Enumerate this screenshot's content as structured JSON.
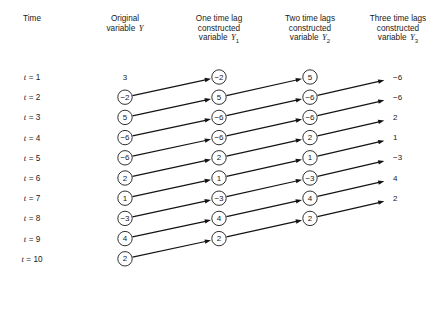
{
  "figure": {
    "columns": [
      {
        "id": "time",
        "header_lines": [
          "Time"
        ],
        "center_x": 32
      },
      {
        "id": "y",
        "header_lines": [
          "Original",
          "variable Y"
        ],
        "center_x": 125,
        "var_name": "Y",
        "var_sub": ""
      },
      {
        "id": "y1",
        "header_lines": [
          "One time lag",
          "constructed",
          "variable Y1"
        ],
        "center_x": 219,
        "var_name": "Y",
        "var_sub": "1"
      },
      {
        "id": "y2",
        "header_lines": [
          "Two time lags",
          "constructed",
          "variable Y2"
        ],
        "center_x": 310,
        "var_name": "Y",
        "var_sub": "2"
      },
      {
        "id": "y3",
        "header_lines": [
          "Three time lags",
          "constructed",
          "variable Y3"
        ],
        "center_x": 398,
        "var_name": "Y",
        "var_sub": "3"
      }
    ],
    "header_text": {
      "time": "Time",
      "y_line1": "Original",
      "y_line2": "variable",
      "y1_line1": "One time lag",
      "y1_line2": "constructed",
      "y1_line3": "variable",
      "y2_line1": "Two time lags",
      "y2_line2": "constructed",
      "y2_line3": "variable",
      "y3_line1": "Three time lags",
      "y3_line2": "constructed",
      "y3_line3": "variable",
      "var_letter": "Y",
      "sub1": "1",
      "sub2": "2",
      "sub3": "3"
    },
    "time_labels": [
      "t = 1",
      "t = 2",
      "t = 3",
      "t = 4",
      "t = 5",
      "t = 6",
      "t = 7",
      "t = 8",
      "t = 9",
      "t = 10"
    ],
    "time_var": "t",
    "time_values": [
      1,
      2,
      3,
      4,
      5,
      6,
      7,
      8,
      9,
      10
    ],
    "series": {
      "y": {
        "label": "Original variable Y",
        "values": [
          "3",
          "−2",
          "5",
          "−6",
          "−6",
          "2",
          "1",
          "−3",
          "4",
          "2"
        ],
        "circled": [
          false,
          true,
          true,
          true,
          true,
          true,
          true,
          true,
          true,
          true
        ],
        "rows": [
          1,
          2,
          3,
          4,
          5,
          6,
          7,
          8,
          9,
          10
        ]
      },
      "y1": {
        "label": "One time lag constructed variable Y1",
        "values": [
          "−2",
          "5",
          "−6",
          "−6",
          "2",
          "1",
          "−3",
          "4",
          "2"
        ],
        "circled": [
          true,
          true,
          true,
          true,
          true,
          true,
          true,
          true,
          true
        ],
        "rows": [
          1,
          2,
          3,
          4,
          5,
          6,
          7,
          8,
          9
        ]
      },
      "y2": {
        "label": "Two time lags constructed variable Y2",
        "values": [
          "5",
          "−6",
          "−6",
          "2",
          "1",
          "−3",
          "4",
          "2"
        ],
        "circled": [
          true,
          true,
          true,
          true,
          true,
          true,
          true,
          true
        ],
        "rows": [
          1,
          2,
          3,
          4,
          5,
          6,
          7,
          8
        ]
      },
      "y3": {
        "label": "Three time lags constructed variable Y3",
        "values": [
          "−6",
          "−6",
          "2",
          "1",
          "−3",
          "4",
          "2"
        ],
        "circled": [
          false,
          false,
          false,
          false,
          false,
          false,
          false
        ],
        "rows": [
          1,
          2,
          3,
          4,
          5,
          6,
          7
        ]
      }
    },
    "arrows": [
      {
        "from_col": "y",
        "from_row": 2,
        "to_col": "y1",
        "to_row": 1
      },
      {
        "from_col": "y",
        "from_row": 3,
        "to_col": "y1",
        "to_row": 2
      },
      {
        "from_col": "y",
        "from_row": 4,
        "to_col": "y1",
        "to_row": 3
      },
      {
        "from_col": "y",
        "from_row": 5,
        "to_col": "y1",
        "to_row": 4
      },
      {
        "from_col": "y",
        "from_row": 6,
        "to_col": "y1",
        "to_row": 5
      },
      {
        "from_col": "y",
        "from_row": 7,
        "to_col": "y1",
        "to_row": 6
      },
      {
        "from_col": "y",
        "from_row": 8,
        "to_col": "y1",
        "to_row": 7
      },
      {
        "from_col": "y",
        "from_row": 9,
        "to_col": "y1",
        "to_row": 8
      },
      {
        "from_col": "y",
        "from_row": 10,
        "to_col": "y1",
        "to_row": 9
      },
      {
        "from_col": "y1",
        "from_row": 2,
        "to_col": "y2",
        "to_row": 1
      },
      {
        "from_col": "y1",
        "from_row": 3,
        "to_col": "y2",
        "to_row": 2
      },
      {
        "from_col": "y1",
        "from_row": 4,
        "to_col": "y2",
        "to_row": 3
      },
      {
        "from_col": "y1",
        "from_row": 5,
        "to_col": "y2",
        "to_row": 4
      },
      {
        "from_col": "y1",
        "from_row": 6,
        "to_col": "y2",
        "to_row": 5
      },
      {
        "from_col": "y1",
        "from_row": 7,
        "to_col": "y2",
        "to_row": 6
      },
      {
        "from_col": "y1",
        "from_row": 8,
        "to_col": "y2",
        "to_row": 7
      },
      {
        "from_col": "y1",
        "from_row": 9,
        "to_col": "y2",
        "to_row": 8
      },
      {
        "from_col": "y2",
        "from_row": 2,
        "to_col": "y3",
        "to_row": 1
      },
      {
        "from_col": "y2",
        "from_row": 3,
        "to_col": "y3",
        "to_row": 2
      },
      {
        "from_col": "y2",
        "from_row": 4,
        "to_col": "y3",
        "to_row": 3
      },
      {
        "from_col": "y2",
        "from_row": 5,
        "to_col": "y3",
        "to_row": 4
      },
      {
        "from_col": "y2",
        "from_row": 6,
        "to_col": "y3",
        "to_row": 5
      },
      {
        "from_col": "y2",
        "from_row": 7,
        "to_col": "y3",
        "to_row": 6
      },
      {
        "from_col": "y2",
        "from_row": 8,
        "to_col": "y3",
        "to_row": 7
      }
    ],
    "geometry": {
      "row0_y": 77,
      "row_step": 20.2,
      "circle_r": 7.2,
      "col_x": {
        "time": 32,
        "y": 125,
        "y1": 219,
        "y2": 310,
        "y3": 398
      }
    },
    "colors": {
      "background": "#ffffff",
      "ink": "#1a1a1a",
      "arrow": "#141414",
      "circle_fill": "#ffffff"
    }
  },
  "chart_data": {
    "type": "table",
    "categories": [
      "t = 1",
      "t = 2",
      "t = 3",
      "t = 4",
      "t = 5",
      "t = 6",
      "t = 7",
      "t = 8",
      "t = 9",
      "t = 10"
    ],
    "series": [
      {
        "name": "Original variable Y",
        "values": [
          3,
          -2,
          5,
          -6,
          -6,
          2,
          1,
          -3,
          4,
          2
        ]
      },
      {
        "name": "One time lag constructed variable Y1",
        "values": [
          -2,
          5,
          -6,
          -6,
          2,
          1,
          -3,
          4,
          2,
          null
        ]
      },
      {
        "name": "Two time lags constructed variable Y2",
        "values": [
          5,
          -6,
          -6,
          2,
          1,
          -3,
          4,
          2,
          null,
          null
        ]
      },
      {
        "name": "Three time lags constructed variable Y3",
        "values": [
          -6,
          -6,
          2,
          1,
          -3,
          4,
          2,
          null,
          null,
          null
        ]
      }
    ],
    "xlabel": "Time",
    "ylabel": "Value",
    "legend": [
      "Original variable Y",
      "One time lag constructed variable Y1",
      "Two time lags constructed variable Y2",
      "Three time lags constructed variable Y3"
    ],
    "grid": false
  }
}
